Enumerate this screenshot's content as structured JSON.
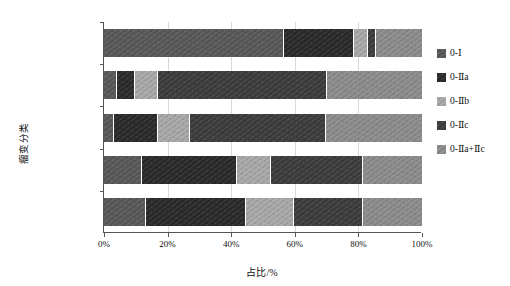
{
  "chart_data": {
    "type": "bar",
    "orientation": "horizontal",
    "stacked": true,
    "stacked_mode": "percent",
    "title": "",
    "xlabel": "占比/%",
    "ylabel": "瘤变分类",
    "xlim": [
      0,
      100
    ],
    "xticks": [
      0,
      20,
      40,
      60,
      80,
      100
    ],
    "xtick_labels": [
      "0%",
      "20%",
      "40%",
      "60%",
      "80%",
      "100%"
    ],
    "grid": "vertical",
    "legend_position": "right",
    "categories": [
      "其他",
      "黏膜下癌",
      "黏膜癌",
      "高级别瘤变",
      "低级别瘤变/腺瘤"
    ],
    "series": [
      {
        "name": "0-Ⅰ",
        "color": "#595959",
        "values": [
          56.5,
          4.0,
          3.2,
          11.8,
          13.2
        ]
      },
      {
        "name": "0-Ⅱa",
        "color": "#2b2b2b",
        "values": [
          22.0,
          5.7,
          13.8,
          29.9,
          31.6
        ]
      },
      {
        "name": "0-Ⅱb",
        "color": "#a8a8a8",
        "values": [
          4.5,
          7.3,
          10.0,
          10.7,
          14.8
        ]
      },
      {
        "name": "0-Ⅱc",
        "color": "#3d3d3d",
        "values": [
          2.5,
          53.0,
          42.8,
          29.1,
          21.9
        ]
      },
      {
        "name": "0-Ⅱa+Ⅱc",
        "color": "#8c8c8c",
        "values": [
          14.5,
          30.0,
          30.2,
          18.5,
          18.5
        ]
      }
    ]
  },
  "legend": {
    "items": [
      {
        "label": "0-Ⅰ",
        "color": "#595959"
      },
      {
        "label": "0-Ⅱa",
        "color": "#2b2b2b"
      },
      {
        "label": "0-Ⅱb",
        "color": "#a8a8a8"
      },
      {
        "label": "0-Ⅱc",
        "color": "#3d3d3d"
      },
      {
        "label": "0-Ⅱa+Ⅱc",
        "color": "#8c8c8c"
      }
    ]
  }
}
